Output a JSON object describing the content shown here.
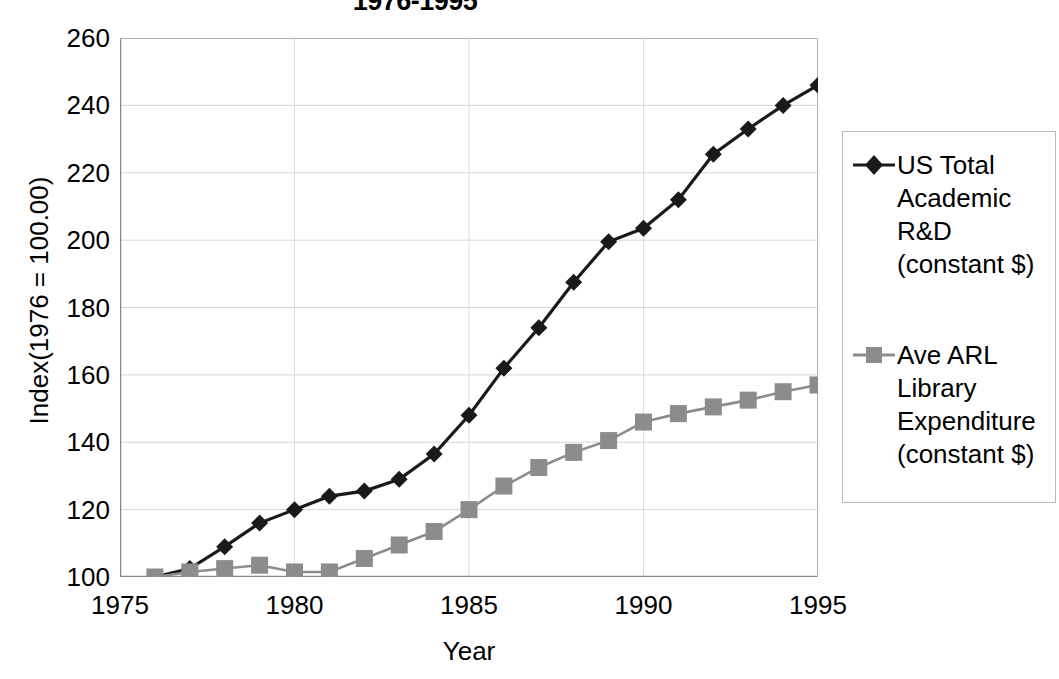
{
  "title": "1976-1995",
  "axes": {
    "x_label": "Year",
    "y_label": "Index(1976 = 100.00)",
    "x_ticks": [
      "1975",
      "1980",
      "1985",
      "1990",
      "1995"
    ],
    "y_ticks": [
      "260",
      "240",
      "220",
      "200",
      "180",
      "160",
      "140",
      "120",
      "100"
    ]
  },
  "legend": {
    "entries": [
      {
        "label": "US Total\nAcademic\nR&D\n(constant $)",
        "marker": "diamond-marker",
        "color": "#1a1a1a"
      },
      {
        "label": "Ave ARL\nLibrary\nExpenditure\n(constant $)",
        "marker": "square-marker",
        "color": "#8c8c8c"
      }
    ]
  },
  "chart_data": {
    "type": "line",
    "title": "1976-1995",
    "xlabel": "Year",
    "ylabel": "Index(1976 = 100.00)",
    "xlim": [
      1975,
      1995
    ],
    "ylim": [
      100,
      260
    ],
    "xticks": [
      1975,
      1980,
      1985,
      1990,
      1995
    ],
    "yticks": [
      100,
      120,
      140,
      160,
      180,
      200,
      220,
      240,
      260
    ],
    "grid": true,
    "legend_position": "right",
    "x": [
      1976,
      1977,
      1978,
      1979,
      1980,
      1981,
      1982,
      1983,
      1984,
      1985,
      1986,
      1987,
      1988,
      1989,
      1990,
      1991,
      1992,
      1993,
      1994,
      1995
    ],
    "series": [
      {
        "name": "US Total Academic R&D (constant $)",
        "marker": "diamond",
        "color": "#1a1a1a",
        "values": [
          100,
          102.5,
          109,
          116,
          120,
          124,
          125.5,
          129,
          136.5,
          148,
          162,
          174,
          187.5,
          199.5,
          203.5,
          212,
          225.5,
          233,
          240,
          246
        ]
      },
      {
        "name": "Ave ARL Library Expenditure (constant $)",
        "marker": "square",
        "color": "#8c8c8c",
        "values": [
          100,
          101.5,
          102.5,
          103.5,
          101.5,
          101.5,
          105.5,
          109.5,
          113.5,
          120,
          127,
          132.5,
          137,
          140.5,
          146,
          148.5,
          150.5,
          152.5,
          155,
          157
        ]
      }
    ]
  }
}
